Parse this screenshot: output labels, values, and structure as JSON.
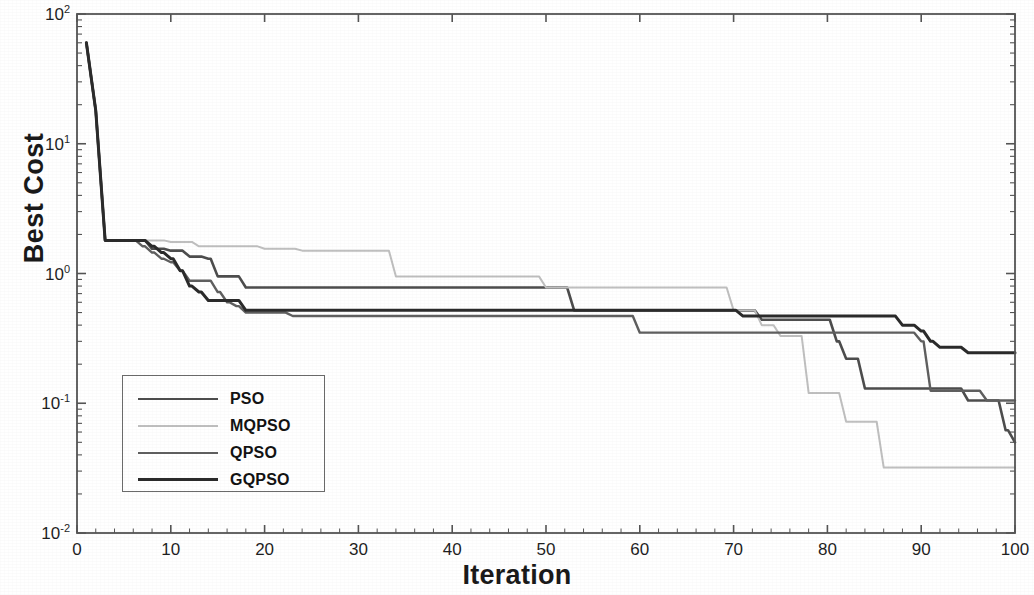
{
  "chart_data": {
    "type": "line",
    "title": "",
    "xlabel": "Iteration",
    "ylabel": "Best Cost",
    "yscale": "log",
    "xlim": [
      0,
      100
    ],
    "ylim": [
      0.01,
      100
    ],
    "grid": false,
    "legend_position": "lower-left-inside",
    "xticks": [
      "0",
      "10",
      "20",
      "30",
      "40",
      "50",
      "60",
      "70",
      "80",
      "90",
      "100"
    ],
    "yticks": [
      "10^2",
      "10^1",
      "10^0",
      "10^-1",
      "10^-2"
    ],
    "ytick_labels": [
      {
        "mantissa": "10",
        "exponent": "2"
      },
      {
        "mantissa": "10",
        "exponent": "1"
      },
      {
        "mantissa": "10",
        "exponent": "0"
      },
      {
        "mantissa": "10",
        "exponent": "-1"
      },
      {
        "mantissa": "10",
        "exponent": "-2"
      }
    ],
    "series": [
      {
        "name": "PSO",
        "color": "#4d4d4d",
        "width": 2.6,
        "x": [
          1,
          2,
          3,
          4,
          7,
          8,
          10,
          12,
          14,
          15,
          17,
          18,
          20,
          22,
          23,
          25,
          27,
          30,
          40,
          50,
          52,
          53,
          59,
          60,
          70,
          72,
          73,
          79,
          80,
          81,
          82,
          84,
          85,
          90,
          95,
          98,
          99,
          100
        ],
        "y": [
          60,
          18,
          1.8,
          1.8,
          1.8,
          1.55,
          1.5,
          1.35,
          1.3,
          0.95,
          0.95,
          0.78,
          0.78,
          0.78,
          0.78,
          0.78,
          0.78,
          0.78,
          0.78,
          0.78,
          0.78,
          0.52,
          0.52,
          0.52,
          0.52,
          0.52,
          0.44,
          0.44,
          0.44,
          0.3,
          0.22,
          0.13,
          0.13,
          0.13,
          0.105,
          0.105,
          0.062,
          0.05
        ]
      },
      {
        "name": "MQPSO",
        "color": "#bfbfbf",
        "width": 2.0,
        "x": [
          1,
          2,
          3,
          4,
          8,
          10,
          12,
          13,
          15,
          16,
          18,
          20,
          22,
          24,
          26,
          30,
          33,
          34,
          38,
          40,
          45,
          50,
          55,
          58,
          60,
          65,
          70,
          72,
          73,
          74,
          75,
          76,
          77,
          78,
          80,
          81,
          82,
          84,
          85,
          86,
          90,
          95,
          100
        ],
        "y": [
          60,
          18,
          1.8,
          1.8,
          1.8,
          1.75,
          1.75,
          1.62,
          1.62,
          1.62,
          1.62,
          1.55,
          1.55,
          1.5,
          1.5,
          1.5,
          1.5,
          0.95,
          0.95,
          0.95,
          0.95,
          0.78,
          0.78,
          0.78,
          0.78,
          0.78,
          0.52,
          0.52,
          0.4,
          0.4,
          0.33,
          0.33,
          0.33,
          0.12,
          0.12,
          0.12,
          0.072,
          0.072,
          0.072,
          0.032,
          0.032,
          0.032,
          0.032
        ]
      },
      {
        "name": "QPSO",
        "color": "#5f5f5f",
        "width": 2.4,
        "x": [
          1,
          2,
          3,
          4,
          6,
          7,
          8,
          9,
          10,
          11,
          12,
          14,
          15,
          16,
          17,
          18,
          20,
          22,
          23,
          25,
          30,
          40,
          50,
          55,
          59,
          60,
          65,
          70,
          71,
          72,
          75,
          80,
          85,
          88,
          90,
          91,
          92,
          95,
          97,
          100
        ],
        "y": [
          60,
          18,
          1.8,
          1.8,
          1.8,
          1.62,
          1.45,
          1.3,
          1.22,
          1.05,
          0.88,
          0.88,
          0.72,
          0.6,
          0.56,
          0.5,
          0.5,
          0.5,
          0.47,
          0.47,
          0.47,
          0.47,
          0.47,
          0.47,
          0.47,
          0.35,
          0.35,
          0.35,
          0.35,
          0.35,
          0.35,
          0.35,
          0.35,
          0.35,
          0.3,
          0.125,
          0.125,
          0.125,
          0.105,
          0.105
        ]
      },
      {
        "name": "GQPSO",
        "color": "#2b2b2b",
        "width": 3.0,
        "x": [
          1,
          2,
          3,
          4,
          6,
          8,
          9,
          10,
          11,
          12,
          13,
          14,
          16,
          18,
          20,
          22,
          25,
          30,
          40,
          50,
          58,
          59,
          60,
          65,
          70,
          71,
          72,
          75,
          80,
          85,
          88,
          90,
          91,
          92,
          95,
          97,
          100
        ],
        "y": [
          60,
          18,
          1.8,
          1.8,
          1.8,
          1.62,
          1.45,
          1.3,
          1.05,
          0.8,
          0.72,
          0.62,
          0.62,
          0.52,
          0.52,
          0.52,
          0.52,
          0.52,
          0.52,
          0.52,
          0.52,
          0.52,
          0.52,
          0.52,
          0.52,
          0.47,
          0.47,
          0.47,
          0.47,
          0.47,
          0.4,
          0.36,
          0.3,
          0.27,
          0.245,
          0.245,
          0.245
        ]
      }
    ]
  },
  "legend": {
    "entries": [
      {
        "label": "PSO",
        "color": "#4d4d4d",
        "width": 2.6
      },
      {
        "label": "MQPSO",
        "color": "#bfbfbf",
        "width": 2.0
      },
      {
        "label": "QPSO",
        "color": "#5f5f5f",
        "width": 2.4
      },
      {
        "label": "GQPSO",
        "color": "#2b2b2b",
        "width": 3.0
      }
    ]
  },
  "axes": {
    "frame_color": "#555555",
    "background": "#ffffff"
  }
}
